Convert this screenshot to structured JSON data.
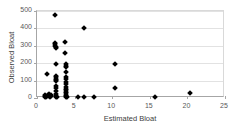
{
  "chart_data": {
    "type": "scatter",
    "title": "",
    "xlabel": "Estimated Bloat",
    "ylabel": "Observed Bloat",
    "xlim": [
      0,
      25
    ],
    "ylim": [
      0,
      500
    ],
    "xticks": [
      0,
      5,
      10,
      15,
      20,
      25
    ],
    "yticks": [
      0,
      100,
      200,
      300,
      400,
      500
    ],
    "grid": "horizontal",
    "legend": "none",
    "marker": "diamond",
    "marker_color": "#000000",
    "series": [
      {
        "name": "observations",
        "points": [
          [
            1.0,
            5
          ],
          [
            1.0,
            12
          ],
          [
            1.1,
            20
          ],
          [
            1.2,
            8
          ],
          [
            1.3,
            138
          ],
          [
            1.4,
            18
          ],
          [
            1.5,
            10
          ],
          [
            1.6,
            22
          ],
          [
            1.7,
            6
          ],
          [
            1.8,
            15
          ],
          [
            1.9,
            9
          ],
          [
            2.4,
            477
          ],
          [
            2.4,
            318
          ],
          [
            2.45,
            310
          ],
          [
            2.45,
            300
          ],
          [
            2.5,
            295
          ],
          [
            2.5,
            288
          ],
          [
            2.5,
            196
          ],
          [
            2.5,
            128
          ],
          [
            2.5,
            120
          ],
          [
            2.5,
            112
          ],
          [
            2.5,
            104
          ],
          [
            2.5,
            96
          ],
          [
            2.5,
            70
          ],
          [
            2.5,
            60
          ],
          [
            2.5,
            40
          ],
          [
            2.5,
            22
          ],
          [
            2.5,
            10
          ],
          [
            2.5,
            4
          ],
          [
            2.6,
            8
          ],
          [
            3.7,
            320
          ],
          [
            3.75,
            258
          ],
          [
            3.8,
            196
          ],
          [
            3.8,
            185
          ],
          [
            3.8,
            176
          ],
          [
            3.85,
            150
          ],
          [
            3.85,
            120
          ],
          [
            3.85,
            108
          ],
          [
            3.85,
            92
          ],
          [
            3.85,
            78
          ],
          [
            3.9,
            64
          ],
          [
            3.9,
            52
          ],
          [
            3.9,
            44
          ],
          [
            3.9,
            36
          ],
          [
            3.9,
            28
          ],
          [
            3.9,
            20
          ],
          [
            3.9,
            14
          ],
          [
            3.9,
            8
          ],
          [
            3.95,
            3
          ],
          [
            5.4,
            6
          ],
          [
            6.2,
            405
          ],
          [
            6.3,
            7
          ],
          [
            7.6,
            8
          ],
          [
            10.4,
            195
          ],
          [
            10.4,
            58
          ],
          [
            15.7,
            7
          ],
          [
            20.4,
            30
          ]
        ]
      }
    ]
  }
}
